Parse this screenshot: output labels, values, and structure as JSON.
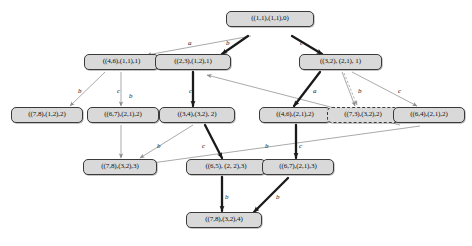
{
  "diagram": {
    "colors": {
      "node_fill": "#d9d9d9",
      "node_border": "#3a3a3a",
      "bold_edge": "#1a1a1a",
      "thin_edge": "#8d8d8d",
      "background": "#ffffff"
    },
    "nodes": [
      {
        "id": "n0",
        "label": "((1,1),(1,1),0)",
        "style": "solid",
        "row": 0
      },
      {
        "id": "n1",
        "label": "((4,6),(1,1),1)",
        "style": "solid",
        "row": 1
      },
      {
        "id": "n2",
        "label": "((2,3),(1,2),1)",
        "style": "solid",
        "row": 1
      },
      {
        "id": "n3",
        "label": "((3,2), (2,1), 1)",
        "style": "solid",
        "row": 1
      },
      {
        "id": "n4",
        "label": "((7,8),(1,2),2)",
        "style": "solid",
        "row": 2
      },
      {
        "id": "n5",
        "label": "((6,7),(2,1),2)",
        "style": "solid",
        "row": 2
      },
      {
        "id": "n6",
        "label": "((3,4),(3,2), 2)",
        "style": "solid",
        "row": 2
      },
      {
        "id": "n7",
        "label": "((4,6),(2,1),2)",
        "style": "solid",
        "row": 2
      },
      {
        "id": "n8",
        "label": "((7,3),(3,2),2)",
        "style": "dashed",
        "row": 2
      },
      {
        "id": "n9",
        "label": "((6,4),(2,1),2)",
        "style": "solid",
        "row": 2
      },
      {
        "id": "n10",
        "label": "((7,8),(3,2),3)",
        "style": "solid",
        "row": 3
      },
      {
        "id": "n11",
        "label": "((6,5), (2, 2),3)",
        "style": "solid",
        "row": 3
      },
      {
        "id": "n12",
        "label": "((6,7),(2,1),3)",
        "style": "solid",
        "row": 3
      },
      {
        "id": "n13",
        "label": "((7,8),(3,2),4)",
        "style": "solid",
        "row": 4
      }
    ],
    "edge_labels": [
      {
        "id": "l0",
        "text": "a"
      },
      {
        "id": "l1",
        "text": "b"
      },
      {
        "id": "l2",
        "text": "c"
      },
      {
        "id": "l3",
        "text": "b"
      },
      {
        "id": "l4",
        "text": "c"
      },
      {
        "id": "l5",
        "text": "b"
      },
      {
        "id": "l6",
        "text": "c"
      },
      {
        "id": "l7",
        "text": "a"
      },
      {
        "id": "l8",
        "text": "b"
      },
      {
        "id": "l9",
        "text": "c"
      },
      {
        "id": "l10",
        "text": "b"
      },
      {
        "id": "l11",
        "text": "c"
      },
      {
        "id": "l12",
        "text": "b"
      },
      {
        "id": "l13",
        "text": "c"
      },
      {
        "id": "l14",
        "text": "b"
      },
      {
        "id": "l15",
        "text": "b"
      }
    ],
    "edges": [
      {
        "from": "n0",
        "to": "n1",
        "label": "a",
        "weight": "thin"
      },
      {
        "from": "n0",
        "to": "n2",
        "label": "b",
        "weight": "bold"
      },
      {
        "from": "n0",
        "to": "n3",
        "label": "c",
        "weight": "bold"
      },
      {
        "from": "n1",
        "to": "n4",
        "label": "b",
        "weight": "thin"
      },
      {
        "from": "n1",
        "to": "n5",
        "label": "c",
        "weight": "thin"
      },
      {
        "from": "n2",
        "to": "n6",
        "label": "c",
        "weight": "bold"
      },
      {
        "from": "n3",
        "to": "n7",
        "label": "a",
        "weight": "bold"
      },
      {
        "from": "n3",
        "to": "n8",
        "label": "b",
        "weight": "thin"
      },
      {
        "from": "n3",
        "to": "n9",
        "label": "c",
        "weight": "thin"
      },
      {
        "from": "n5",
        "to": "n10",
        "label": "b",
        "weight": "thin"
      },
      {
        "from": "n6",
        "to": "n11",
        "label": "c",
        "weight": "bold"
      },
      {
        "from": "n6",
        "to": "n10",
        "label": "b",
        "weight": "thin"
      },
      {
        "from": "n7",
        "to": "n12",
        "label": "c",
        "weight": "bold"
      },
      {
        "from": "n9",
        "to": "n2",
        "label": "b",
        "weight": "thin"
      },
      {
        "from": "n8",
        "to": "n10",
        "label": "",
        "weight": "thin"
      },
      {
        "from": "n11",
        "to": "n13",
        "label": "b",
        "weight": "bold"
      },
      {
        "from": "n12",
        "to": "n13",
        "label": "",
        "weight": "bold"
      }
    ]
  }
}
